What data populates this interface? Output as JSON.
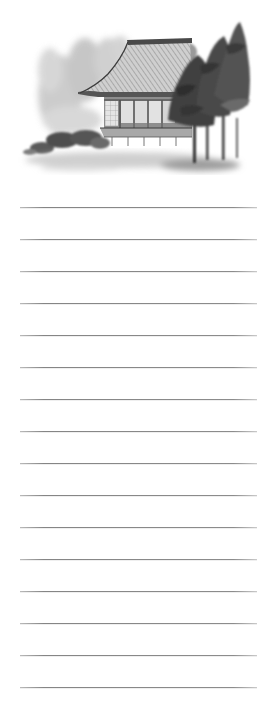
{
  "page": {
    "type": "ruled-notepad",
    "background_color": "#ffffff"
  },
  "illustration": {
    "subject": "ink-wash-japanese-house-with-pine-trees",
    "palette": {
      "ink_dark": "#3a3a3a",
      "ink_mid": "#6e6e6e",
      "ink_light": "#b5b5b5",
      "wash": "#d4d4d4"
    }
  },
  "ruled_lines": {
    "count": 16,
    "first_y": 207,
    "spacing": 32,
    "x_start": 20,
    "x_end": 257,
    "color": "#8a8a8a",
    "lines": [
      {
        "y": 207
      },
      {
        "y": 239
      },
      {
        "y": 271
      },
      {
        "y": 303
      },
      {
        "y": 335
      },
      {
        "y": 367
      },
      {
        "y": 399
      },
      {
        "y": 431
      },
      {
        "y": 463
      },
      {
        "y": 495
      },
      {
        "y": 527
      },
      {
        "y": 559
      },
      {
        "y": 591
      },
      {
        "y": 623
      },
      {
        "y": 655
      },
      {
        "y": 687
      }
    ]
  }
}
